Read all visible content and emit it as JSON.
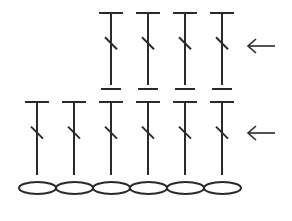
{
  "diagram": {
    "type": "crochet-stitch-chart",
    "stroke_color": "#2a2a2a",
    "background": "#ffffff",
    "foundation_chain": {
      "symbol": "chain-oval",
      "count": 6,
      "start_x": 19,
      "y": 188,
      "width": 37,
      "height": 12
    },
    "rows": [
      {
        "name": "row-1",
        "stitch_symbol": "double-crochet",
        "count": 6,
        "xs": [
          37,
          74,
          111,
          148,
          185,
          222
        ],
        "top_y": 102,
        "bottom_y": 175,
        "arrow": {
          "direction": "left",
          "y": 133,
          "x1": 248,
          "x2": 275
        }
      },
      {
        "name": "row-2",
        "stitch_symbol": "double-crochet",
        "count": 4,
        "xs": [
          111,
          148,
          185,
          222
        ],
        "top_y": 13,
        "bottom_y": 85,
        "base_bar_y": 89,
        "arrow": {
          "direction": "left",
          "y": 46,
          "x1": 248,
          "x2": 275
        }
      }
    ]
  }
}
